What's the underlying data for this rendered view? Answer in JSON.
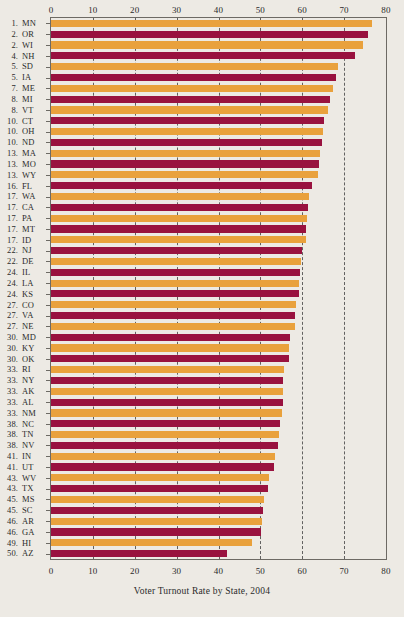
{
  "chart_data": {
    "type": "bar",
    "orientation": "horizontal",
    "title": "Voter Turnout Rate by State, 2004",
    "xlabel": "Voter Turnout Rate by State, 2004",
    "ylabel": "",
    "xlim": [
      0,
      80
    ],
    "xticks": [
      0,
      10,
      20,
      30,
      40,
      50,
      60,
      70,
      80
    ],
    "xticklabels": [
      "0",
      "10",
      "20",
      "30",
      "40",
      "50",
      "60",
      "70",
      "80"
    ],
    "gridlines": [
      10,
      20,
      30,
      40,
      50,
      60,
      70
    ],
    "grid": true,
    "grid_style": "dashed",
    "legend": null,
    "axis_top": true,
    "axis_bottom": true,
    "colors": {
      "orange": "#e9a13c",
      "maroon": "#99123f",
      "background": "#edeae4",
      "axis": "#6d6a64",
      "text": "#2b2b2b"
    },
    "categories": [
      "MN",
      "OR",
      "WI",
      "NH",
      "SD",
      "IA",
      "ME",
      "MI",
      "VT",
      "CT",
      "OH",
      "ND",
      "MA",
      "MO",
      "WY",
      "FL",
      "WA",
      "CA",
      "PA",
      "MT",
      "ID",
      "NJ",
      "DE",
      "IL",
      "LA",
      "KS",
      "CO",
      "VA",
      "NE",
      "MD",
      "KY",
      "OK",
      "RI",
      "NY",
      "AK",
      "AL",
      "NM",
      "NC",
      "TN",
      "NV",
      "IN",
      "UT",
      "WV",
      "TX",
      "MS",
      "SC",
      "AR",
      "GA",
      "HI",
      "AZ"
    ],
    "ranks": [
      "1.",
      "2.",
      "2.",
      "4.",
      "5.",
      "5.",
      "7.",
      "8.",
      "8.",
      "10.",
      "10.",
      "10.",
      "13.",
      "13.",
      "13.",
      "16.",
      "17.",
      "17.",
      "17.",
      "17.",
      "17.",
      "22.",
      "22.",
      "24.",
      "24.",
      "24.",
      "27.",
      "27.",
      "27.",
      "30.",
      "30.",
      "30.",
      "33.",
      "33.",
      "33.",
      "33.",
      "33.",
      "38.",
      "38.",
      "38.",
      "41.",
      "41.",
      "43.",
      "43.",
      "45.",
      "45.",
      "46.",
      "46.",
      "49.",
      "50."
    ],
    "values": [
      76.6,
      75.6,
      74.6,
      72.6,
      68.5,
      68.0,
      67.4,
      66.6,
      66.2,
      65.1,
      65.0,
      64.8,
      64.2,
      64.0,
      63.8,
      62.3,
      61.6,
      61.3,
      61.2,
      61.0,
      60.9,
      59.9,
      59.8,
      59.4,
      59.3,
      59.2,
      58.4,
      58.3,
      58.2,
      57.0,
      56.9,
      56.8,
      55.6,
      55.5,
      55.4,
      55.3,
      55.2,
      54.6,
      54.4,
      54.2,
      53.4,
      53.2,
      52.1,
      51.9,
      50.8,
      50.6,
      50.3,
      50.1,
      48.1,
      42.0
    ],
    "bar_colors": [
      "orange",
      "maroon",
      "orange",
      "maroon",
      "orange",
      "maroon",
      "orange",
      "maroon",
      "orange",
      "maroon",
      "orange",
      "maroon",
      "orange",
      "maroon",
      "orange",
      "maroon",
      "orange",
      "maroon",
      "orange",
      "maroon",
      "orange",
      "maroon",
      "orange",
      "maroon",
      "orange",
      "maroon",
      "orange",
      "maroon",
      "orange",
      "maroon",
      "orange",
      "maroon",
      "orange",
      "maroon",
      "orange",
      "maroon",
      "orange",
      "maroon",
      "orange",
      "maroon",
      "orange",
      "maroon",
      "orange",
      "maroon",
      "orange",
      "maroon",
      "orange",
      "maroon",
      "orange",
      "maroon"
    ]
  }
}
